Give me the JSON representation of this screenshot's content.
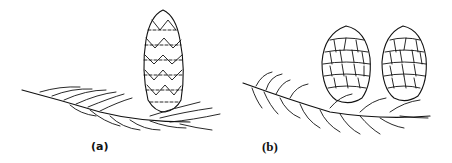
{
  "figure": {
    "panels": [
      {
        "id": "a",
        "label": "(a)",
        "description": "single upright cone on needled branch"
      },
      {
        "id": "b",
        "label": "(b)",
        "description": "two upright cones on needled branch"
      }
    ],
    "colors": {
      "ink": "#111111",
      "background": "#ffffff"
    }
  }
}
